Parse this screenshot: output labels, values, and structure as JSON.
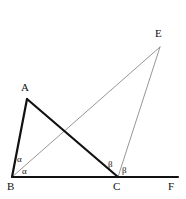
{
  "figure": {
    "type": "geometry-diagram",
    "width": 186,
    "height": 199,
    "background_color": "#ffffff",
    "colors": {
      "thick_stroke": "#111111",
      "thin_stroke": "#8a8a8a",
      "label_text": "#111111"
    },
    "stroke_widths": {
      "thick": 2.2,
      "thin": 0.9
    },
    "points": {
      "A": {
        "label": "A",
        "x": 27,
        "y": 99,
        "label_x": 21,
        "label_y": 82
      },
      "B": {
        "label": "B",
        "x": 12,
        "y": 177,
        "label_x": 7,
        "label_y": 181
      },
      "C": {
        "label": "C",
        "x": 118,
        "y": 177,
        "label_x": 113,
        "label_y": 181
      },
      "E": {
        "label": "E",
        "x": 160,
        "y": 47,
        "label_x": 155,
        "label_y": 28
      },
      "F": {
        "label": "F",
        "x": 178,
        "y": 177,
        "label_x": 168,
        "label_y": 181
      }
    },
    "segments": [
      {
        "name": "segment-BA",
        "from": "B",
        "to": "A",
        "weight": "thick"
      },
      {
        "name": "segment-AC",
        "from": "A",
        "to": "C",
        "weight": "thick"
      },
      {
        "name": "segment-BF",
        "from": "B",
        "to": "F",
        "weight": "thick"
      },
      {
        "name": "segment-BE",
        "from": "B",
        "to": "E",
        "weight": "thin"
      },
      {
        "name": "segment-CE",
        "from": "C",
        "to": "E",
        "weight": "thin"
      }
    ],
    "angle_labels": [
      {
        "name": "angle-alpha-upper",
        "text": "α",
        "x": 17,
        "y": 155
      },
      {
        "name": "angle-alpha-lower",
        "text": "α",
        "x": 22,
        "y": 167
      },
      {
        "name": "angle-beta-left",
        "text": "β",
        "x": 108,
        "y": 160
      },
      {
        "name": "angle-beta-right",
        "text": "β",
        "x": 122,
        "y": 166
      }
    ]
  }
}
